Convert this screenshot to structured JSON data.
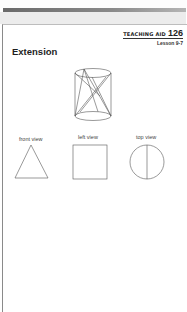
{
  "header": {
    "aid_label": "TEACHING AID",
    "aid_number": "126",
    "lesson": "Lesson 9-7"
  },
  "section": {
    "title": "Extension"
  },
  "figure": {
    "solid": "cylinder-with-inscribed-lines-icon",
    "views": [
      {
        "label": "front view",
        "shape": "triangle"
      },
      {
        "label": "left view",
        "shape": "square"
      },
      {
        "label": "top view",
        "shape": "circle-with-diameter"
      }
    ]
  },
  "colors": {
    "line": "#555555",
    "text": "#222222",
    "top_bar": "#7a7a7a",
    "band": "#ececec"
  }
}
